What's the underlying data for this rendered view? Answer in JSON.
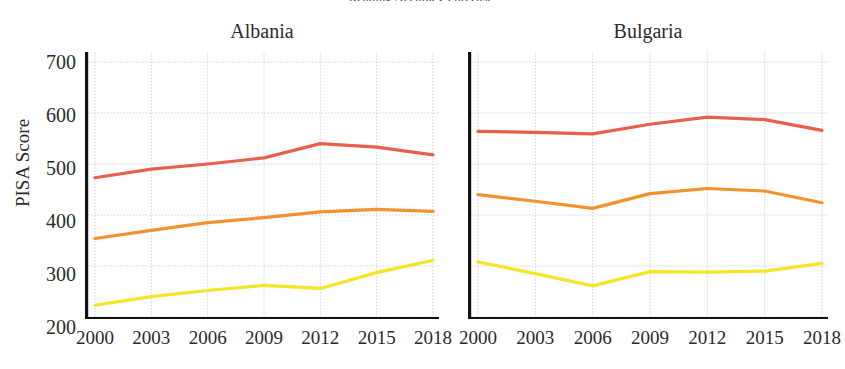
{
  "figure": {
    "suptitle": "Reading Accuracy Forecast",
    "ylabel": "PISA Score"
  },
  "colors": {
    "reading": "#e8604c",
    "math": "#f1922e",
    "science": "#f5e529",
    "grid": "#b9c4cf",
    "spine": "#121212",
    "text": "#2b2b2b",
    "background": "#ffffff"
  },
  "axis": {
    "y_ticks": [
      "700",
      "600",
      "500",
      "400",
      "300",
      "200"
    ],
    "x_ticks": [
      "2000",
      "2003",
      "2006",
      "2009",
      "2012",
      "2015",
      "2018"
    ]
  },
  "panels": [
    {
      "title": "Albania"
    },
    {
      "title": "Bulgaria"
    }
  ],
  "chart_data": {
    "type": "line",
    "title": "Reading Accuracy Forecast",
    "xlabel": "",
    "ylabel": "PISA Score",
    "ylim": [
      200,
      700
    ],
    "ytick_values": [
      200,
      300,
      400,
      500,
      600,
      700
    ],
    "grid": true,
    "legend": "none",
    "x": [
      2000,
      2003,
      2006,
      2009,
      2012,
      2015,
      2018
    ],
    "panels": [
      {
        "name": "Albania",
        "series": [
          {
            "name": "reading",
            "color": "#e8604c",
            "values": [
              473,
              490,
              500,
              512,
              540,
              533,
              518
            ]
          },
          {
            "name": "math",
            "color": "#f1922e",
            "values": [
              354,
              370,
              385,
              395,
              406,
              411,
              407
            ]
          },
          {
            "name": "science",
            "color": "#f5e529",
            "values": [
              223,
              240,
              252,
              262,
              256,
              287,
              311
            ]
          }
        ]
      },
      {
        "name": "Bulgaria",
        "series": [
          {
            "name": "reading",
            "color": "#e8604c",
            "values": [
              564,
              562,
              559,
              578,
              592,
              587,
              566
            ]
          },
          {
            "name": "math",
            "color": "#f1922e",
            "values": [
              440,
              427,
              413,
              442,
              452,
              447,
              424
            ]
          },
          {
            "name": "science",
            "color": "#f5e529",
            "values": [
              308,
              285,
              261,
              289,
              288,
              290,
              305
            ]
          }
        ]
      }
    ]
  }
}
